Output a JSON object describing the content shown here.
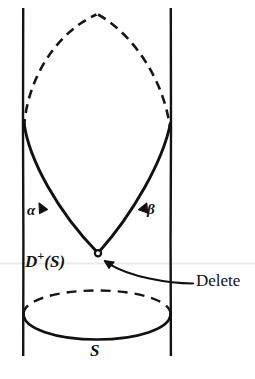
{
  "figure": {
    "background_color": "#ffffff",
    "ink_color": "#111111",
    "scan_line_color": "#e8e8e8",
    "width": 255,
    "height": 379,
    "labels": {
      "alpha": "α",
      "beta": "β",
      "d_plus_s_base": "D",
      "d_plus_s_sup": "+",
      "d_plus_s_arg": "(S)",
      "s": "S",
      "delete": "Delete"
    },
    "elements": [
      {
        "name": "left-world-line",
        "kind": "vertical-line",
        "style": "solid",
        "x": 23,
        "y_top": 8,
        "y_bottom": 356
      },
      {
        "name": "right-world-line",
        "kind": "vertical-line",
        "style": "solid",
        "x": 171,
        "y_top": 8,
        "y_bottom": 356
      },
      {
        "name": "upper-dashed-arch",
        "kind": "curve",
        "style": "dashed",
        "peak": [
          97,
          14
        ],
        "left_foot": [
          24,
          127
        ],
        "right_foot": [
          170,
          127
        ]
      },
      {
        "name": "left-solid-null-ray",
        "kind": "curve",
        "style": "solid",
        "from": [
          24,
          124
        ],
        "to": [
          98,
          253
        ],
        "arrow_direction": "down-right",
        "label": "α"
      },
      {
        "name": "right-solid-null-ray",
        "kind": "curve",
        "style": "solid",
        "from": [
          98,
          253
        ],
        "to": [
          170,
          124
        ],
        "arrow_direction": "up-right",
        "label": "β"
      },
      {
        "name": "vertex-point",
        "kind": "open-circle",
        "center": [
          98,
          253
        ],
        "radius": 3
      },
      {
        "name": "surface-ellipse-back",
        "kind": "ellipse-half",
        "style": "dashed",
        "center": [
          97,
          315
        ],
        "rx": 74,
        "ry": 25,
        "half": "top"
      },
      {
        "name": "surface-ellipse-front",
        "kind": "ellipse-half",
        "style": "solid",
        "center": [
          97,
          315
        ],
        "rx": 74,
        "ry": 25,
        "half": "bottom"
      },
      {
        "name": "delete-callout-arrow",
        "kind": "curved-arrow",
        "from": [
          193,
          283
        ],
        "to": [
          104,
          262
        ],
        "arrowhead": "at-to"
      },
      {
        "name": "scan-artifact-line",
        "kind": "horizontal-line",
        "y": 263,
        "color": "#e8e8e8"
      }
    ]
  }
}
